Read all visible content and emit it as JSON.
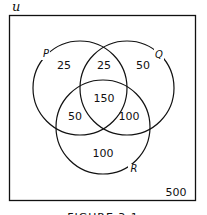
{
  "universe": {
    "symbol": "u"
  },
  "sets": {
    "P": {
      "label": "P",
      "cx": 80,
      "cy": 88,
      "r": 47
    },
    "Q": {
      "label": "Q",
      "cx": 127,
      "cy": 88,
      "r": 47
    },
    "R": {
      "label": "R",
      "cx": 103,
      "cy": 127,
      "r": 47
    }
  },
  "regions": {
    "p_only": "25",
    "p_q_only": "25",
    "q_only": "50",
    "p_q_r": "150",
    "p_r_only": "50",
    "q_r_only": "100",
    "r_only": "100",
    "outside": "500"
  },
  "caption": "FIGURE 3.1"
}
